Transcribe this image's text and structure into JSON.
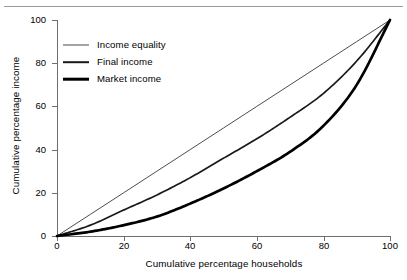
{
  "chart_data": {
    "type": "line",
    "title": "",
    "subtitle": "",
    "xlabel": "Cumulative percentage households",
    "ylabel": "Cumulative percentage income",
    "xlim": [
      0,
      100
    ],
    "ylim": [
      0,
      100
    ],
    "xticks": [
      "0",
      "20",
      "40",
      "60",
      "80",
      "100"
    ],
    "yticks": [
      "0",
      "20",
      "40",
      "60",
      "80",
      "100"
    ],
    "grid": false,
    "legend_position": "upper-left-inside",
    "x": [
      0,
      10,
      20,
      30,
      40,
      50,
      60,
      70,
      80,
      90,
      100
    ],
    "series": [
      {
        "name": "Income equality",
        "values": [
          0,
          10,
          20,
          30,
          40,
          50,
          60,
          70,
          80,
          90,
          100
        ],
        "color": "#4d4d4d",
        "line_width": 1.0
      },
      {
        "name": "Final income",
        "values": [
          0,
          5,
          12,
          19,
          27,
          36,
          45,
          55,
          66,
          81,
          100
        ],
        "color": "#1a1a1a",
        "line_width": 1.7
      },
      {
        "name": "Market income",
        "values": [
          0,
          2,
          5,
          9,
          15,
          22,
          30,
          39,
          51,
          70,
          100
        ],
        "color": "#000000",
        "line_width": 2.7
      }
    ]
  },
  "axes": {
    "x_title": "Cumulative percentage households",
    "y_title": "Cumulative percentage income",
    "x_tick_labels": [
      "0",
      "20",
      "40",
      "60",
      "80",
      "100"
    ],
    "y_tick_labels": [
      "0",
      "20",
      "40",
      "60",
      "80",
      "100"
    ]
  },
  "legend": {
    "items": [
      {
        "label": "Income equality",
        "style": "thin"
      },
      {
        "label": "Final income",
        "style": "medium"
      },
      {
        "label": "Market income",
        "style": "thick"
      }
    ]
  }
}
